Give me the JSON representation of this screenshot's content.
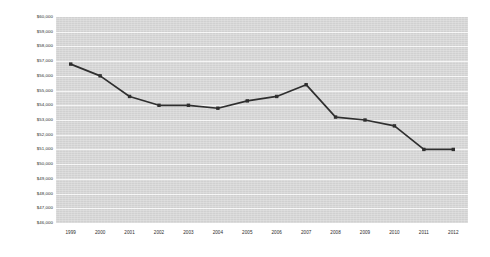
{
  "chart_data": {
    "type": "line",
    "title": "",
    "subtitle": "",
    "xlabel": "",
    "ylabel": "",
    "categories": [
      "1999",
      "2000",
      "2001",
      "2002",
      "2003",
      "2004",
      "2005",
      "2006",
      "2007",
      "2008",
      "2009",
      "2010",
      "2011",
      "2012"
    ],
    "values": [
      56800,
      56000,
      54600,
      54000,
      54000,
      53800,
      54300,
      54600,
      55400,
      53200,
      53000,
      52600,
      51000,
      51000
    ],
    "series": [
      {
        "name": "",
        "values": [
          56800,
          56000,
          54600,
          54000,
          54000,
          53800,
          54300,
          54600,
          55400,
          53200,
          53000,
          52600,
          51000,
          51000
        ]
      }
    ],
    "ylim": [
      46000,
      60000
    ],
    "ytick_step": 1000,
    "ytick_labels": [
      "$60,000",
      "$59,000",
      "$58,000",
      "$57,000",
      "$56,000",
      "$55,000",
      "$54,000",
      "$53,000",
      "$52,000",
      "$51,000",
      "$50,000",
      "$49,000",
      "$48,000",
      "$47,000",
      "$46,000"
    ],
    "ytick_values": [
      60000,
      59000,
      58000,
      57000,
      56000,
      55000,
      54000,
      53000,
      52000,
      51000,
      50000,
      49000,
      48000,
      47000,
      46000
    ],
    "xtick_labels": [
      "1999",
      "2000",
      "2001",
      "2002",
      "2003",
      "2004",
      "2005",
      "2006",
      "2007",
      "2008",
      "2009",
      "2010",
      "2011",
      "2012"
    ],
    "grid": {
      "horizontal": true,
      "vertical": false,
      "color": "#ffffff"
    },
    "legend": {
      "visible": false,
      "position": "none",
      "entries": []
    },
    "colors": {
      "line": "#2f2f2f",
      "marker": "#2f2f2f",
      "plot_background": "#d7d7d7",
      "figure_background": "#ffffff",
      "grid": "#ffffff",
      "tick_text": "#2b2b2b"
    },
    "marker": "square",
    "annotations": []
  }
}
